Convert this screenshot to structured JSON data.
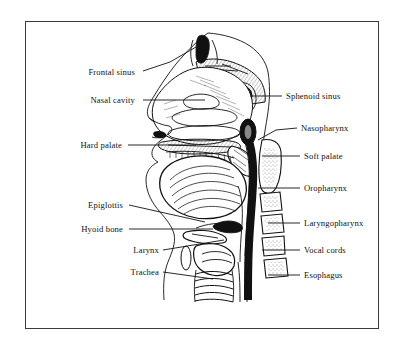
{
  "figure": {
    "frame_color": "#3a3a3a",
    "ink_color": "#111111",
    "background": "#ffffff"
  },
  "labels_left": [
    {
      "id": "frontal-sinus",
      "text": "Frontal sinus",
      "x": 140,
      "y": 72,
      "tip_x": 196,
      "tip_y": 47,
      "bend": true
    },
    {
      "id": "nasal-cavity",
      "text": "Nasal cavity",
      "x": 140,
      "y": 100,
      "tip_x": 205,
      "tip_y": 100,
      "bend": false
    },
    {
      "id": "hard-palate",
      "text": "Hard palate",
      "x": 125,
      "y": 145,
      "tip_x": 196,
      "tip_y": 145,
      "bend": false
    },
    {
      "id": "epiglottis",
      "text": "Epiglottis",
      "x": 126,
      "y": 205,
      "tip_x": 205,
      "tip_y": 222,
      "bend": false
    },
    {
      "id": "hyoid-bone",
      "text": "Hyoid bone",
      "x": 126,
      "y": 229,
      "tip_x": 213,
      "tip_y": 229,
      "bend": false
    },
    {
      "id": "larynx",
      "text": "Larynx",
      "x": 160,
      "y": 250,
      "tip_x": 224,
      "tip_y": 240,
      "bend": false
    },
    {
      "id": "trachea",
      "text": "Trachea",
      "x": 160,
      "y": 272,
      "tip_x": 213,
      "tip_y": 279,
      "bend": false
    }
  ],
  "labels_right": [
    {
      "id": "sphenoid-sinus",
      "text": "Sphenoid sinus",
      "x": 285,
      "y": 96,
      "tip_x": 250,
      "tip_y": 96
    },
    {
      "id": "nasopharynx",
      "text": "Nasopharynx",
      "x": 300,
      "y": 128,
      "tip_x": 258,
      "tip_y": 140
    },
    {
      "id": "soft-palate",
      "text": "Soft palate",
      "x": 303,
      "y": 156,
      "tip_x": 262,
      "tip_y": 156
    },
    {
      "id": "oropharynx",
      "text": "Oropharynx",
      "x": 303,
      "y": 188,
      "tip_x": 258,
      "tip_y": 188
    },
    {
      "id": "laryngopharynx",
      "text": "Laryngopharynx",
      "x": 303,
      "y": 223,
      "tip_x": 268,
      "tip_y": 223
    },
    {
      "id": "vocal-cords",
      "text": "Vocal cords",
      "x": 303,
      "y": 250,
      "tip_x": 262,
      "tip_y": 250
    },
    {
      "id": "esophagus",
      "text": "Esophagus",
      "x": 303,
      "y": 275,
      "tip_x": 268,
      "tip_y": 275
    }
  ],
  "structures": [
    "frontal-sinus-cavity",
    "nasal-cavity",
    "nasal-conchae",
    "sphenoid-sinus",
    "hard-palate",
    "soft-palate",
    "nasopharynx",
    "oropharynx",
    "laryngopharynx",
    "tongue",
    "epiglottis",
    "hyoid-bone",
    "larynx",
    "vocal-cords",
    "trachea",
    "esophagus",
    "cervical-vertebrae"
  ],
  "vertebrae_count": 5
}
